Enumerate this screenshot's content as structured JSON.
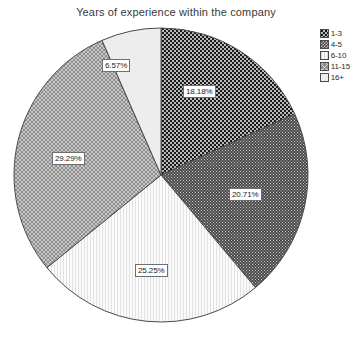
{
  "chart_data": {
    "type": "pie",
    "title": "Years of experience within the company",
    "xlabel": "",
    "ylabel": "",
    "legend_position": "right",
    "grid": false,
    "categories": [
      "1-3",
      "4-5",
      "6-10",
      "11-15",
      "16+"
    ],
    "values": [
      18.18,
      20.71,
      25.25,
      29.29,
      6.57
    ],
    "labels": [
      "18.18%",
      "20.71%",
      "25.25%",
      "29.29%",
      "6.57%"
    ],
    "slices": [
      {
        "name": "1-3",
        "value": 18.18,
        "label": "18.18%",
        "pattern": "checkerboard-dark",
        "fill": "#2b2b2b",
        "label_x": 183,
        "label_y": 85
      },
      {
        "name": "4-5",
        "value": 20.71,
        "label": "20.71%",
        "pattern": "fine-dot-gray",
        "fill": "#5b5b5b",
        "label_x": 229,
        "label_y": 188
      },
      {
        "name": "6-10",
        "value": 25.25,
        "label": "25.25%",
        "pattern": "vertical-light",
        "fill": "#f2f2f2",
        "label_x": 135,
        "label_y": 264
      },
      {
        "name": "11-15",
        "value": 29.29,
        "label": "29.29%",
        "pattern": "diagonal-cross-gray",
        "fill": "#8a8a8a",
        "label_x": 52,
        "label_y": 152
      },
      {
        "name": "16+",
        "value": 6.57,
        "label": "6.57%",
        "pattern": "plain-light",
        "fill": "#ededed",
        "label_x": 102,
        "label_y": 59
      }
    ]
  },
  "chart": {
    "title": "Years of experience within the company"
  },
  "legend": {
    "items": [
      {
        "label": "1-3",
        "pattern": "checkerboard-dark"
      },
      {
        "label": "4-5",
        "pattern": "fine-dot-gray"
      },
      {
        "label": "6-10",
        "pattern": "vertical-light"
      },
      {
        "label": "11-15",
        "pattern": "diagonal-cross-gray"
      },
      {
        "label": "16+",
        "pattern": "plain-light"
      }
    ]
  }
}
